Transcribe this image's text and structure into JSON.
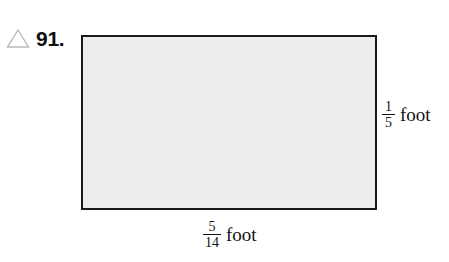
{
  "problem": {
    "marker_icon": "triangle-outline-icon",
    "number_label": "91."
  },
  "figure": {
    "shape": "rectangle",
    "fill_color": "#ededed",
    "stroke_color": "#1a1a1a",
    "dimensions": {
      "height_label": {
        "numerator": "1",
        "denominator": "5",
        "unit": "foot"
      },
      "width_label": {
        "numerator": "5",
        "denominator": "14",
        "unit": "foot"
      }
    }
  },
  "page": {
    "background_color": "#ffffff"
  }
}
